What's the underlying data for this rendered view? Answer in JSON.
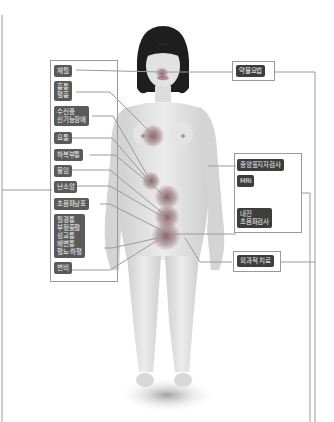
{
  "diagram": {
    "figure": "female-body",
    "left_symptoms": [
      {
        "label": "재월"
      },
      {
        "label": "흉통\n혈흉"
      },
      {
        "label": "수신증\n신기능장애"
      },
      {
        "label": "요통"
      },
      {
        "label": "하복부통"
      },
      {
        "label": "불임"
      },
      {
        "label": "난소암"
      },
      {
        "label": "초음파낭포"
      },
      {
        "label": "월경통\n부정출혈\n성교통\n배변통\n혈뇨·하혈"
      },
      {
        "label": "변비"
      }
    ],
    "right_treatments": {
      "drug": {
        "label": "약물요법"
      },
      "tests": [
        {
          "label": "종양표지자검사"
        },
        {
          "label": "MRI"
        },
        {
          "label": "내진\n초음파검사"
        }
      ],
      "surgery": {
        "label": "외과적 치료"
      }
    },
    "colors": {
      "label_bg": "#5a5a5a",
      "label_dark_bg": "#3d3d3d",
      "frame": "#9a9a9a",
      "spot": "#8c5a64"
    }
  }
}
